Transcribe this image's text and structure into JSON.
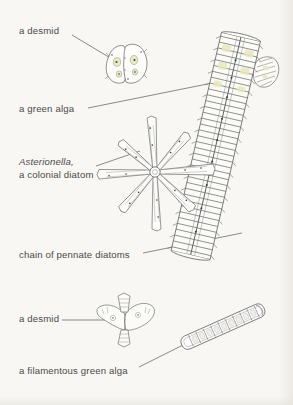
{
  "figure": {
    "background_color": "#f8f7f4",
    "ink_color": "#555555",
    "label_color": "#4a4a4a",
    "width": 293,
    "height": 405
  },
  "labels": {
    "desmid_top": "a desmid",
    "green_alga": "a green alga",
    "asterionella_genus": "Asterionella,",
    "asterionella_desc": "a colonial diatom",
    "pennate_chain": "chain of pennate diatoms",
    "desmid_lower": "a desmid",
    "filamentous_alga": "a filamentous green alga"
  },
  "organisms": [
    {
      "name": "desmid-butterfly",
      "label": "a desmid",
      "center_x": 125,
      "center_y": 62,
      "form": "two-lobed bowtie cell with notched margins"
    },
    {
      "name": "green-alga-small",
      "label": "a green alga",
      "center_x": 267,
      "center_y": 72,
      "form": "short banded capsule"
    },
    {
      "name": "asterionella-colony",
      "label": "Asterionella, a colonial diatom",
      "center_x": 155,
      "center_y": 172,
      "form": "radial star colony of eight needle cells"
    },
    {
      "name": "pennate-diatom-chain",
      "label": "chain of pennate diatoms",
      "center_x": 216,
      "center_y": 145,
      "form": "long ladder-like stack of stacked pennate cells"
    },
    {
      "name": "desmid-stellate",
      "label": "a desmid",
      "center_x": 125,
      "center_y": 315,
      "form": "two semicells with horn-like spined arms"
    },
    {
      "name": "filamentous-green-alga",
      "label": "a filamentous green alga",
      "center_x": 222,
      "center_y": 327,
      "form": "diagonal chain of rectangular cells"
    }
  ],
  "leaders": [
    {
      "name": "leader-desmid-top",
      "from_x": 72,
      "from_y": 35,
      "to_x": 111,
      "to_y": 58,
      "arrow": true
    },
    {
      "name": "leader-green-alga",
      "from_x": 88,
      "from_y": 108,
      "to_x": 258,
      "to_y": 74,
      "arrow": false
    },
    {
      "name": "leader-asterionella",
      "from_x": 96,
      "from_y": 166,
      "to_x": 139,
      "to_y": 152,
      "arrow": false
    },
    {
      "name": "leader-pennate",
      "from_x": 143,
      "from_y": 253,
      "to_x": 241,
      "to_y": 234,
      "arrow": false
    },
    {
      "name": "leader-desmid-low",
      "from_x": 62,
      "from_y": 320,
      "to_x": 104,
      "to_y": 320,
      "arrow": false
    },
    {
      "name": "leader-filament",
      "from_x": 139,
      "from_y": 368,
      "to_x": 184,
      "to_y": 344,
      "arrow": false
    }
  ]
}
